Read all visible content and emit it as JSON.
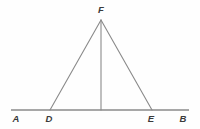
{
  "figure": {
    "background_color": "#fefefe",
    "line_color": "#8a8a8a",
    "label_color": "#3a3a3a",
    "baseline": {
      "name": "line-AB",
      "x1": 11,
      "y1": 110,
      "x2": 189,
      "y2": 110,
      "stroke_width": 1.6
    },
    "segments": [
      {
        "name": "segment-DF",
        "x1": 50,
        "y1": 110,
        "x2": 101,
        "y2": 20,
        "stroke_width": 1.1
      },
      {
        "name": "segment-FE",
        "x1": 101,
        "y1": 20,
        "x2": 152,
        "y2": 110,
        "stroke_width": 1.1
      },
      {
        "name": "altitude-F-to-base",
        "x1": 101,
        "y1": 20,
        "x2": 101,
        "y2": 110,
        "stroke_width": 1.1
      }
    ],
    "points": [
      {
        "name": "point-F",
        "label": "F",
        "x": 101,
        "y": 20,
        "label_x": 101,
        "label_y": 13
      },
      {
        "name": "point-A",
        "label": "A",
        "x": 16,
        "y": 110,
        "label_x": 16,
        "label_y": 122
      },
      {
        "name": "point-D",
        "label": "D",
        "x": 50,
        "y": 110,
        "label_x": 49,
        "label_y": 122
      },
      {
        "name": "point-E",
        "label": "E",
        "x": 152,
        "y": 110,
        "label_x": 151,
        "label_y": 122
      },
      {
        "name": "point-B",
        "label": "B",
        "x": 183,
        "y": 110,
        "label_x": 183,
        "label_y": 122
      }
    ]
  }
}
